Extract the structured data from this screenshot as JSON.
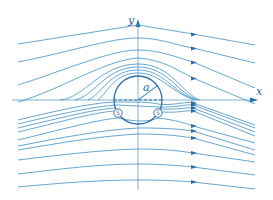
{
  "diagram": {
    "title": "",
    "axes": {
      "x_label": "x",
      "y_label": "y"
    },
    "cylinder": {
      "radius_label": "a"
    },
    "separation_points": [
      {
        "label": "S",
        "side": "left"
      },
      {
        "label": "S",
        "side": "right"
      }
    ],
    "colors": {
      "streamline": "#3f8fc4",
      "cylinder": "#2a6fa8",
      "axis": "#4a8fc0",
      "background": "#ffffff"
    }
  }
}
